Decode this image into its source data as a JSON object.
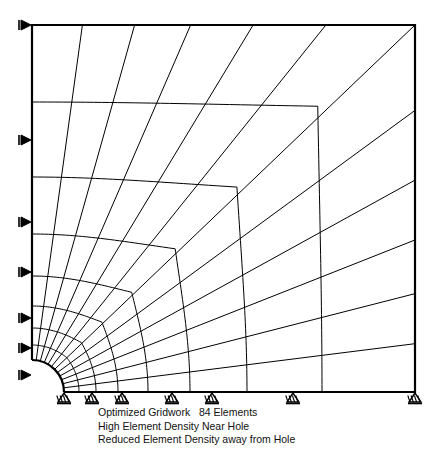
{
  "figure": {
    "kind": "finite-element-mesh",
    "stroke_color": "#000000",
    "background_color": "#ffffff",
    "line_width": 1.0,
    "boundary_line_width": 2.2
  },
  "caption": {
    "line1": "Optimized Gridwork   84 Elements",
    "line2": "High Element Density Near Hole",
    "line3": "Reduced Element Density away from Hole"
  },
  "geometry": {
    "plate_left": 32,
    "plate_top": 25,
    "plate_right": 415,
    "plate_bottom": 392,
    "hole_center_x": 32,
    "hole_center_y": 392,
    "hole_radius": 32,
    "element_count": 84,
    "radial_divisions": 12,
    "ring_divisions": 7
  },
  "mesh": {
    "radial_angles_deg": [
      0,
      7.5,
      15,
      22.5,
      30,
      37.5,
      45,
      52.5,
      60,
      67.5,
      75,
      82.5,
      90
    ],
    "ring_radii": [
      32,
      47,
      64,
      86,
      116,
      158,
      215,
      290,
      383
    ],
    "ring_squareness": [
      0.0,
      0.1,
      0.22,
      0.36,
      0.52,
      0.68,
      0.84,
      0.95,
      1.0
    ],
    "left_edge_node_y": [
      25,
      140,
      222,
      272,
      318,
      348,
      375,
      392
    ],
    "bottom_edge_node_x": [
      64,
      92,
      122,
      172,
      212,
      293,
      415
    ],
    "top_edge_node_x": [
      98,
      150,
      210,
      277,
      345,
      415
    ],
    "right_edge_node_y": [
      25,
      90,
      152,
      222,
      285,
      340,
      392
    ]
  },
  "supports": {
    "left_label": "roller-support-horizontal",
    "bottom_label": "pin-support-vertical",
    "left_count": 8,
    "bottom_count": 7,
    "left_y": [
      25,
      140,
      222,
      272,
      318,
      348,
      375
    ],
    "bottom_x": [
      64,
      92,
      122,
      172,
      212,
      293,
      415
    ]
  }
}
